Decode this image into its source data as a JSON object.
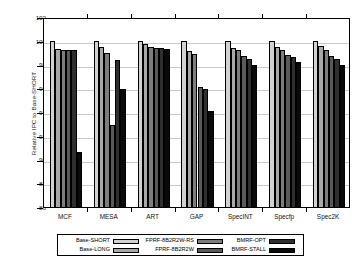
{
  "chart_data": {
    "type": "bar",
    "title": "",
    "xlabel": "",
    "ylabel": "Relative IPC to Base-SHORT",
    "ylim": [
      86,
      102
    ],
    "yticks": [
      86,
      88,
      90,
      92,
      94,
      96,
      98,
      100,
      102
    ],
    "grid": true,
    "legend_position": "bottom",
    "categories": [
      "MCF",
      "MESA",
      "ART",
      "GAP",
      "SpecINT",
      "Specfp",
      "Spec2K"
    ],
    "series": [
      {
        "name": "Base-SHORT",
        "color": "#d2d2d2",
        "values": [
          100.0,
          100.0,
          100.0,
          100.0,
          100.0,
          100.0,
          100.0
        ]
      },
      {
        "name": "Base-LONG",
        "color": "#a8a8a8",
        "values": [
          99.3,
          99.5,
          99.7,
          99.1,
          99.4,
          99.5,
          99.6
        ]
      },
      {
        "name": "FPRF-8B2R2W-RS",
        "color": "#7d7d7d",
        "values": [
          99.2,
          99.0,
          99.5,
          98.9,
          99.2,
          99.2,
          99.2
        ]
      },
      {
        "name": "FPRF-8B2R2W",
        "color": "#5a5a5a",
        "values": [
          99.2,
          92.9,
          99.4,
          96.1,
          98.7,
          98.8,
          98.7
        ]
      },
      {
        "name": "BMRF-OPT",
        "color": "#2f2f2f",
        "values": [
          99.2,
          98.4,
          99.4,
          95.9,
          98.5,
          98.6,
          98.5
        ]
      },
      {
        "name": "BMRF-STALL",
        "color": "#0a0a0a",
        "values": [
          90.6,
          95.9,
          99.3,
          94.1,
          98.0,
          98.2,
          98.0
        ]
      }
    ]
  },
  "legend": {
    "entries": [
      {
        "label": "Base-SHORT",
        "color": "#d2d2d2"
      },
      {
        "label": "Base-LONG",
        "color": "#a8a8a8"
      },
      {
        "label": "FPRF-8B2R2W-RS",
        "color": "#7d7d7d"
      },
      {
        "label": "FPRF-8B2R2W",
        "color": "#5a5a5a"
      },
      {
        "label": "BMRF-OPT",
        "color": "#2f2f2f"
      },
      {
        "label": "BMRF-STALL",
        "color": "#0a0a0a"
      }
    ]
  }
}
